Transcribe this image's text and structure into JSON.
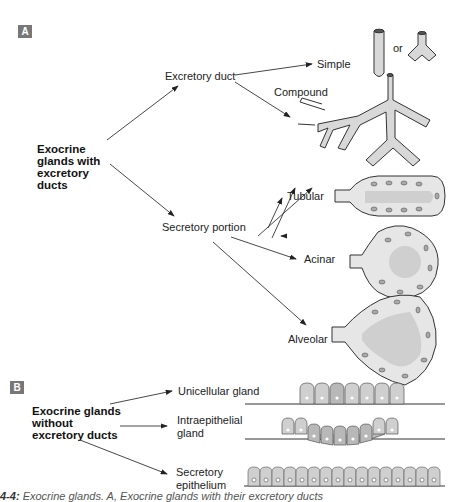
{
  "panels": {
    "a": {
      "badge": "A",
      "root": "Exocrine glands with excretory ducts",
      "excretory_duct": "Excretory duct",
      "simple": "Simple",
      "or": "or",
      "compound": "Compound",
      "secretory_portion": "Secretory portion",
      "tubular": "Tubular",
      "acinar": "Acinar",
      "alveolar": "Alveolar"
    },
    "b": {
      "badge": "B",
      "root": "Exocrine glands without excretory ducts",
      "unicellular": "Unicellular gland",
      "intraepithelial_1": "Intraepithelial",
      "intraepithelial_2": "gland",
      "secretory_1": "Secretory",
      "secretory_2": "epithelium"
    }
  },
  "caption": {
    "number": "4-4:",
    "text": "Exocrine glands. A, Exocrine glands with their excretory ducts"
  },
  "colors": {
    "fill": "#d4d4d4",
    "cell": "#e8e8e8",
    "nucleus": "#a8a8a8",
    "outline": "#333333",
    "badge": "#777777"
  }
}
